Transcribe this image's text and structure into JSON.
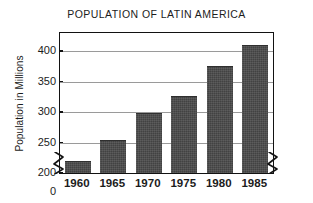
{
  "chart_data": {
    "type": "bar",
    "title": "POPULATION OF LATIN AMERICA",
    "xlabel": "",
    "ylabel": "Population in Millions",
    "categories": [
      "1960",
      "1965",
      "1970",
      "1975",
      "1980",
      "1985"
    ],
    "values": [
      220,
      255,
      298,
      327,
      375,
      410
    ],
    "series": [
      {
        "name": "Population",
        "values": [
          220,
          255,
          298,
          327,
          375,
          410
        ]
      }
    ],
    "ylim": [
      200,
      430
    ],
    "yticks": [
      "0",
      "200",
      "250",
      "300",
      "350",
      "400"
    ],
    "ytick_values": [
      0,
      200,
      250,
      300,
      350,
      400
    ],
    "gridlines": [
      250,
      300,
      350,
      400
    ],
    "grid": true,
    "legend": "none",
    "axis_break": {
      "present": true,
      "axis": "y",
      "between": [
        0,
        200
      ],
      "note": "zigzag break on left and right vertical axes just above the baseline"
    },
    "bar_color": "#4a4a4a",
    "frame_color": "#121212",
    "grid_color": "#9a9a9a",
    "background": "#ffffff"
  }
}
